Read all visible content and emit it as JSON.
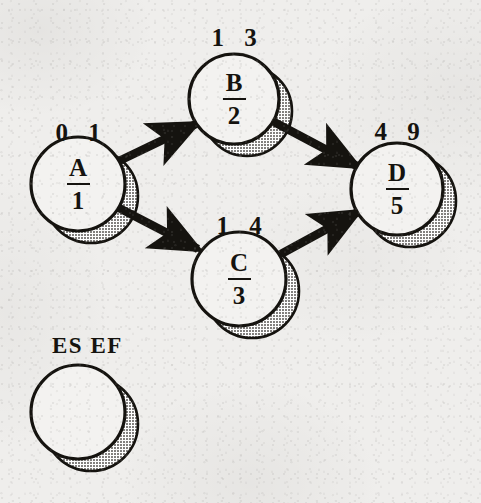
{
  "diagram": {
    "legend": {
      "caption": "ES EF",
      "caption_x": 52,
      "caption_y": 334,
      "circle": {
        "cx": 78,
        "cy": 412,
        "r": 47
      }
    },
    "colors": {
      "ink": "#15130f",
      "circle_fill": "#f3f2f0",
      "shadow_fill": "#b9b7b3",
      "background": "#efeeec"
    },
    "nodes": [
      {
        "id": "A",
        "name": "node-a",
        "letter": "A",
        "duration": "1",
        "es": "0",
        "ef": "1",
        "es_ef_text": "0 1",
        "cx": 78,
        "cy": 184,
        "r": 47,
        "label_x": 78,
        "label_y": 120
      },
      {
        "id": "B",
        "name": "node-b",
        "letter": "B",
        "duration": "2",
        "es": "1",
        "ef": "3",
        "es_ef_text": "1 3",
        "cx": 234,
        "cy": 99,
        "r": 45,
        "label_x": 234,
        "label_y": 25
      },
      {
        "id": "C",
        "name": "node-c",
        "letter": "C",
        "duration": "3",
        "es": "1",
        "ef": "4",
        "es_ef_text": "1 4",
        "cx": 239,
        "cy": 279,
        "r": 47,
        "label_x": 239,
        "label_y": 213
      },
      {
        "id": "D",
        "name": "node-d",
        "letter": "D",
        "duration": "5",
        "es": "4",
        "ef": "9",
        "es_ef_text": "4 9",
        "cx": 397,
        "cy": 189,
        "r": 46,
        "label_x": 397,
        "label_y": 119
      }
    ],
    "edges": [
      {
        "name": "edge-a-to-b",
        "from": "A",
        "to": "B",
        "x1": 119,
        "y1": 161,
        "x2": 196,
        "y2": 124
      },
      {
        "name": "edge-a-to-c",
        "from": "A",
        "to": "C",
        "x1": 119,
        "y1": 208,
        "x2": 198,
        "y2": 249
      },
      {
        "name": "edge-b-to-d",
        "from": "B",
        "to": "D",
        "x1": 274,
        "y1": 122,
        "x2": 357,
        "y2": 166
      },
      {
        "name": "edge-c-to-d",
        "from": "C",
        "to": "D",
        "x1": 281,
        "y1": 254,
        "x2": 358,
        "y2": 212
      }
    ]
  }
}
